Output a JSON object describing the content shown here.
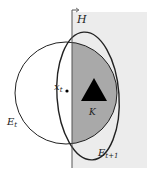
{
  "diagram": {
    "labels": {
      "halfspace": "H",
      "point": "x",
      "point_sub": "t",
      "set": "K",
      "ellipsoid_current": "E",
      "ellipsoid_current_sub": "t",
      "ellipsoid_next": "E",
      "ellipsoid_next_sub": "t+1"
    },
    "colors": {
      "halfspace_fill": "#ececec",
      "intersection_fill": "#a9a9a9",
      "stroke": "#222222",
      "set_fill": "#000000"
    }
  }
}
